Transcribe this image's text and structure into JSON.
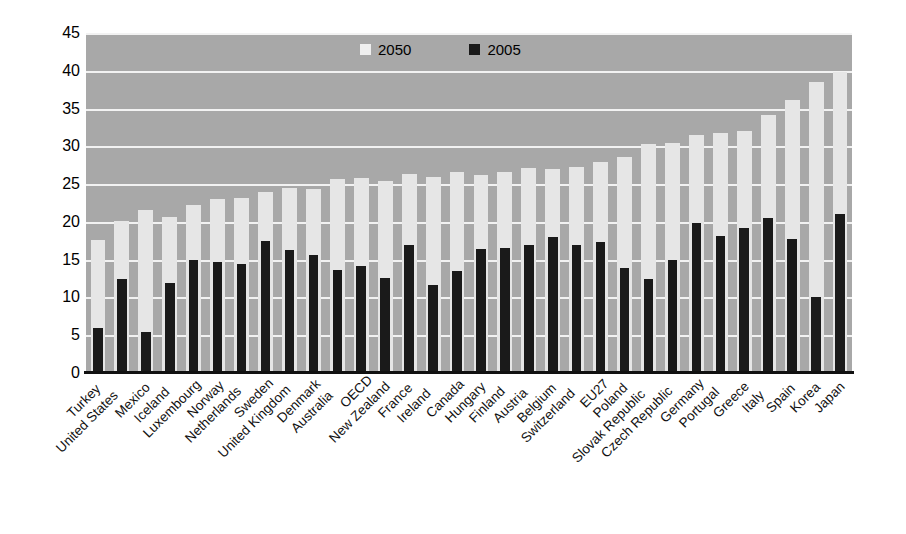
{
  "chart_data": {
    "type": "bar",
    "title": "",
    "subtitle": "",
    "xlabel": "",
    "ylabel": "",
    "ylim": [
      0,
      45
    ],
    "yticks": [
      0,
      5,
      10,
      15,
      20,
      25,
      30,
      35,
      40,
      45
    ],
    "grid": true,
    "legend_position": "top-center",
    "categories": [
      "Turkey",
      "United States",
      "Mexico",
      "Iceland",
      "Luxembourg",
      "Norway",
      "Netherlands",
      "Sweden",
      "United Kingdom",
      "Denmark",
      "Australia",
      "OECD",
      "New Zealand",
      "France",
      "Ireland",
      "Canada",
      "Hungary",
      "Finland",
      "Austria",
      "Belgium",
      "Switzerland",
      "EU27",
      "Poland",
      "Slovak Republic",
      "Czech Republic",
      "Germany",
      "Portugal",
      "Greece",
      "Italy",
      "Spain",
      "Korea",
      "Japan"
    ],
    "series": [
      {
        "name": "2050",
        "color": "#e6e6e6",
        "values": [
          17.6,
          20.1,
          21.6,
          20.7,
          22.2,
          23.0,
          23.2,
          24.0,
          24.5,
          24.3,
          25.7,
          25.8,
          25.4,
          26.3,
          26.0,
          26.6,
          26.2,
          26.6,
          27.2,
          27.0,
          27.3,
          27.9,
          28.6,
          30.3,
          30.5,
          31.5,
          31.8,
          32.0,
          34.1,
          36.2,
          38.5,
          39.9
        ]
      },
      {
        "name": "2005",
        "color": "#1a1a1a",
        "values": [
          5.9,
          12.4,
          5.4,
          11.9,
          14.9,
          14.7,
          14.4,
          17.5,
          16.3,
          15.6,
          13.6,
          14.1,
          12.6,
          16.9,
          11.7,
          13.5,
          16.4,
          16.5,
          16.9,
          18.0,
          17.0,
          17.4,
          13.9,
          12.4,
          15.0,
          19.9,
          18.1,
          19.2,
          20.5,
          17.8,
          10.0,
          21.0
        ]
      }
    ]
  },
  "legend": {
    "items": [
      {
        "label": "2050",
        "swatch": "light-swatch-icon"
      },
      {
        "label": "2005",
        "swatch": "dark-swatch-icon"
      }
    ]
  }
}
